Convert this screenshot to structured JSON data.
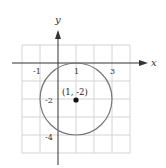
{
  "diagram": {
    "axis_labels": {
      "x": "x",
      "y": "y"
    },
    "x_ticks": [
      {
        "value": -1,
        "label": "-1"
      },
      {
        "value": 1,
        "label": "1"
      },
      {
        "value": 3,
        "label": "3"
      }
    ],
    "y_ticks": [
      {
        "value": -2,
        "label": "-2"
      },
      {
        "value": -4,
        "label": "-4"
      }
    ],
    "circle": {
      "center": [
        1,
        -2
      ],
      "radius": 2
    },
    "center_label": "(1, -2)",
    "colors": {
      "grid": "#d0d0d0",
      "axis": "#333333",
      "circle": "#777777",
      "point": "#111111"
    }
  }
}
